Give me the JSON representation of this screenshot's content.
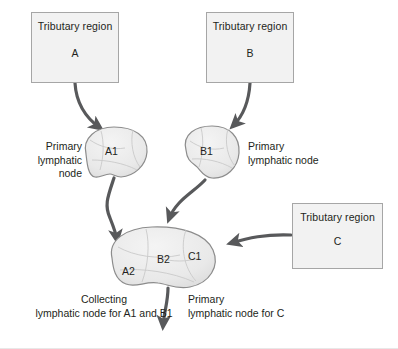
{
  "diagram": {
    "colors": {
      "box_fill": "#f2f2f2",
      "box_border": "#a6a6a6",
      "node_fill": "#ebebeb",
      "node_border": "#8c8c8c",
      "arrow": "#58595b",
      "text": "#231f20",
      "background": "#ffffff"
    },
    "tributary_boxes": [
      {
        "id": "A",
        "title": "Tributary region",
        "letter": "A"
      },
      {
        "id": "B",
        "title": "Tributary region",
        "letter": "B"
      },
      {
        "id": "C",
        "title": "Tributary region",
        "letter": "C"
      }
    ],
    "nodes": [
      {
        "id": "A1",
        "label": "A1"
      },
      {
        "id": "B1",
        "label": "B1"
      },
      {
        "id": "A2",
        "label": "A2"
      },
      {
        "id": "B2",
        "label": "B2"
      },
      {
        "id": "C1",
        "label": "C1"
      }
    ],
    "captions": {
      "primary_left": "Primary\nlymphatic\nnode",
      "primary_right": "Primary\nlymphatic node",
      "collecting": "Collecting\nlymphatic node for A1 and B1",
      "primary_c": "Primary\nlymphatic node for C"
    }
  }
}
